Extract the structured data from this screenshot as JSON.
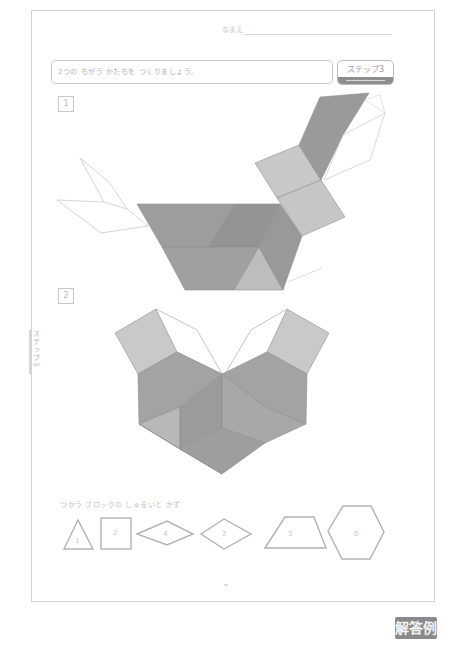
{
  "worksheet": {
    "name_label": "なまえ",
    "instruction": "2つの ちがう かたちを つくりましょう。",
    "step_badge": "ステップ3",
    "side_tab": "ステップ3",
    "answer_badge": "解答例",
    "questions": [
      {
        "number": "1",
        "description": "blocks arranged into a bird-like shape"
      },
      {
        "number": "2",
        "description": "blocks arranged into a heart-like shape"
      }
    ],
    "legend": {
      "title": "つかう ブロックの しゅるいと かず",
      "blocks": [
        {
          "shape": "triangle",
          "count": "1"
        },
        {
          "shape": "square",
          "count": "2"
        },
        {
          "shape": "thin-rhombus",
          "count": "4"
        },
        {
          "shape": "rhombus",
          "count": "2"
        },
        {
          "shape": "trapezoid",
          "count": "3"
        },
        {
          "shape": "hexagon",
          "count": "0"
        }
      ]
    }
  },
  "colors": {
    "dark_block": "#9a9a9a",
    "mid_block": "#b0b0b0",
    "light_block": "#c9c9c9",
    "outline": "#a6a6a6",
    "answer_badge_bg": "#8a8a8a"
  }
}
